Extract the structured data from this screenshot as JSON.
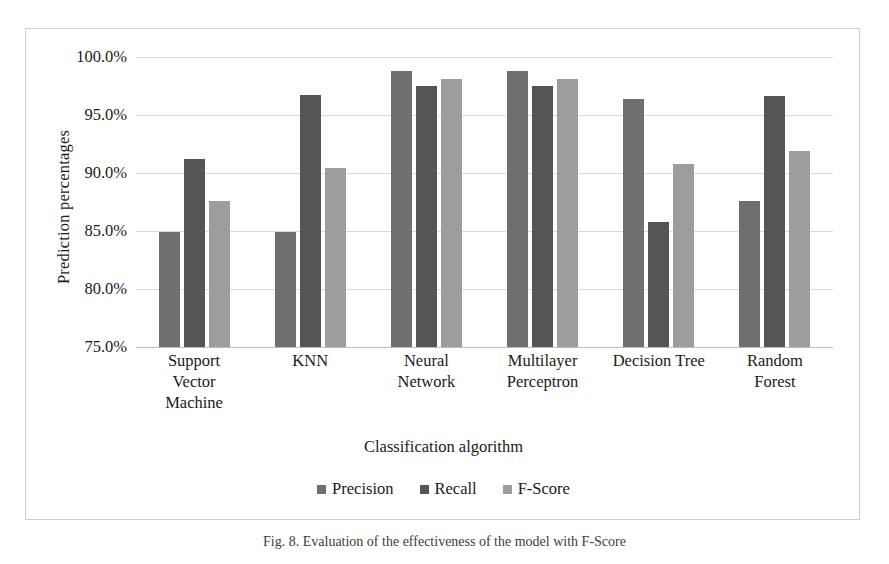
{
  "chart_data": {
    "type": "bar",
    "title": "",
    "xlabel": "Classification algorithm",
    "ylabel": "Prediction percentages",
    "ylim": [
      75.0,
      100.0
    ],
    "ytick_step": 5.0,
    "ytick_labels": [
      "100.0%",
      "95.0%",
      "90.0%",
      "85.0%",
      "80.0%",
      "75.0%"
    ],
    "ytick_values": [
      100.0,
      95.0,
      90.0,
      85.0,
      80.0,
      75.0
    ],
    "grid": true,
    "legend_position": "bottom",
    "categories": [
      "Support\nVector\nMachine",
      "KNN",
      "Neural\nNetwork",
      "Multilayer\nPerceptron",
      "Decision Tree",
      "Random\nForest"
    ],
    "series": [
      {
        "name": "Precision",
        "color": "#6f6f6f",
        "values": [
          84.9,
          84.9,
          98.8,
          98.8,
          96.4,
          87.6
        ]
      },
      {
        "name": "Recall",
        "color": "#555555",
        "values": [
          91.2,
          96.7,
          97.5,
          97.5,
          85.8,
          96.6
        ]
      },
      {
        "name": "F-Score",
        "color": "#9d9d9d",
        "values": [
          87.6,
          90.4,
          98.1,
          98.1,
          90.8,
          91.9
        ]
      }
    ]
  },
  "caption": "Fig. 8.  Evaluation of the effectiveness of the model with F-Score"
}
